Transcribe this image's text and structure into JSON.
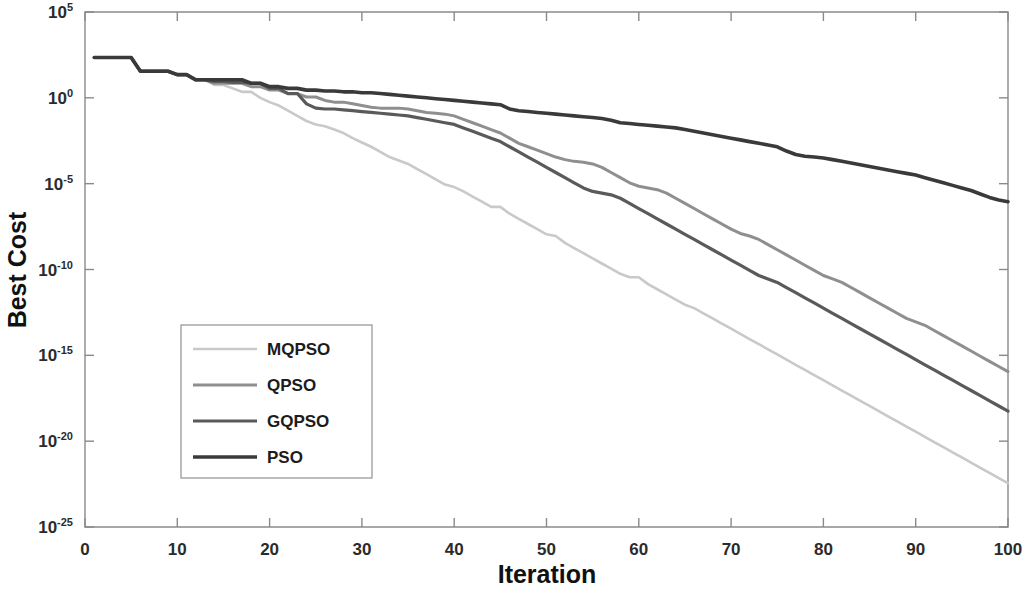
{
  "chart_data": {
    "type": "line",
    "title": "",
    "xlabel": "Iteration",
    "ylabel": "Best Cost",
    "xlim": [
      0,
      100
    ],
    "ylim_log10": [
      -25,
      5
    ],
    "yscale": "log",
    "grid": false,
    "legend_position": "center-left",
    "x_ticks": [
      0,
      10,
      20,
      30,
      40,
      50,
      60,
      70,
      80,
      90,
      100
    ],
    "x_tick_labels": [
      "0",
      "10",
      "20",
      "30",
      "40",
      "50",
      "60",
      "70",
      "80",
      "90",
      "100"
    ],
    "y_ticks_log10": [
      5,
      0,
      -5,
      -10,
      -15,
      -20,
      -25
    ],
    "y_tick_labels": [
      "10^5",
      "10^0",
      "10^-5",
      "10^-10",
      "10^-15",
      "10^-20",
      "10^-25"
    ],
    "y_tick_mantissa": [
      "10",
      "10",
      "10",
      "10",
      "10",
      "10",
      "10"
    ],
    "y_tick_exponents": [
      "5",
      "0",
      "-5",
      "-10",
      "-15",
      "-20",
      "-25"
    ],
    "x": [
      1,
      2,
      3,
      4,
      5,
      6,
      7,
      8,
      9,
      10,
      11,
      12,
      13,
      14,
      15,
      16,
      17,
      18,
      19,
      20,
      21,
      22,
      23,
      24,
      25,
      26,
      27,
      28,
      29,
      30,
      31,
      32,
      33,
      34,
      35,
      36,
      37,
      38,
      39,
      40,
      41,
      42,
      43,
      44,
      45,
      46,
      47,
      48,
      49,
      50,
      51,
      52,
      53,
      54,
      55,
      56,
      57,
      58,
      59,
      60,
      61,
      62,
      63,
      64,
      65,
      66,
      67,
      68,
      69,
      70,
      71,
      72,
      73,
      74,
      75,
      76,
      77,
      78,
      79,
      80,
      81,
      82,
      83,
      84,
      85,
      86,
      87,
      88,
      89,
      90,
      91,
      92,
      93,
      94,
      95,
      96,
      97,
      98,
      99,
      100
    ],
    "series": [
      {
        "name": "MQPSO",
        "color": "#c9c9c9",
        "width": 2.6,
        "values_log10": [
          2.35,
          2.35,
          2.35,
          2.35,
          2.35,
          1.55,
          1.55,
          1.55,
          1.55,
          1.35,
          1.35,
          1.05,
          1.05,
          0.75,
          0.75,
          0.55,
          0.35,
          0.35,
          0.0,
          -0.25,
          -0.45,
          -0.75,
          -1.05,
          -1.35,
          -1.55,
          -1.65,
          -1.85,
          -2.05,
          -2.35,
          -2.6,
          -2.85,
          -3.15,
          -3.45,
          -3.65,
          -3.85,
          -4.15,
          -4.45,
          -4.75,
          -5.05,
          -5.2,
          -5.45,
          -5.75,
          -6.05,
          -6.35,
          -6.35,
          -6.75,
          -7.05,
          -7.35,
          -7.65,
          -7.95,
          -8.05,
          -8.45,
          -8.75,
          -9.05,
          -9.35,
          -9.65,
          -9.95,
          -10.25,
          -10.45,
          -10.45,
          -10.85,
          -11.15,
          -11.45,
          -11.75,
          -12.05,
          -12.25,
          -12.55,
          -12.85,
          -13.15,
          -13.45,
          -13.75,
          -14.05,
          -14.35,
          -14.65,
          -14.95,
          -15.25,
          -15.55,
          -15.85,
          -16.15,
          -16.45,
          -16.75,
          -17.05,
          -17.35,
          -17.65,
          -17.95,
          -18.25,
          -18.55,
          -18.85,
          -19.15,
          -19.45,
          -19.75,
          -20.05,
          -20.35,
          -20.65,
          -20.95,
          -21.25,
          -21.55,
          -21.85,
          -22.15,
          -22.45,
          -22.75
        ]
      },
      {
        "name": "QPSO",
        "color": "#8f8f8f",
        "width": 3.0,
        "values_log10": [
          2.35,
          2.35,
          2.35,
          2.35,
          2.35,
          1.55,
          1.55,
          1.55,
          1.55,
          1.35,
          1.35,
          1.05,
          1.05,
          0.85,
          0.85,
          0.85,
          0.85,
          0.65,
          0.65,
          0.45,
          0.45,
          0.25,
          0.25,
          0.05,
          0.05,
          -0.15,
          -0.25,
          -0.25,
          -0.35,
          -0.45,
          -0.55,
          -0.6,
          -0.6,
          -0.6,
          -0.65,
          -0.75,
          -0.85,
          -0.9,
          -0.95,
          -1.05,
          -1.25,
          -1.45,
          -1.65,
          -1.85,
          -2.05,
          -2.35,
          -2.65,
          -2.85,
          -3.05,
          -3.25,
          -3.45,
          -3.6,
          -3.7,
          -3.75,
          -3.85,
          -4.05,
          -4.35,
          -4.65,
          -4.95,
          -5.15,
          -5.25,
          -5.35,
          -5.55,
          -5.85,
          -6.15,
          -6.45,
          -6.75,
          -7.05,
          -7.35,
          -7.65,
          -7.9,
          -8.05,
          -8.25,
          -8.55,
          -8.85,
          -9.15,
          -9.45,
          -9.75,
          -10.05,
          -10.35,
          -10.55,
          -10.75,
          -11.05,
          -11.35,
          -11.65,
          -11.95,
          -12.25,
          -12.55,
          -12.85,
          -13.05,
          -13.25,
          -13.55,
          -13.85,
          -14.15,
          -14.45,
          -14.75,
          -15.05,
          -15.35,
          -15.65,
          -15.95,
          -16.15
        ]
      },
      {
        "name": "GQPSO",
        "color": "#5a5a5a",
        "width": 3.2,
        "values_log10": [
          2.35,
          2.35,
          2.35,
          2.35,
          2.35,
          1.55,
          1.55,
          1.55,
          1.55,
          1.35,
          1.35,
          1.05,
          1.05,
          0.95,
          0.95,
          0.9,
          0.9,
          0.85,
          0.85,
          0.55,
          0.55,
          0.25,
          0.25,
          -0.35,
          -0.6,
          -0.65,
          -0.65,
          -0.7,
          -0.75,
          -0.8,
          -0.85,
          -0.9,
          -0.95,
          -1.0,
          -1.05,
          -1.15,
          -1.25,
          -1.35,
          -1.45,
          -1.55,
          -1.75,
          -1.95,
          -2.15,
          -2.35,
          -2.55,
          -2.85,
          -3.15,
          -3.45,
          -3.75,
          -4.05,
          -4.35,
          -4.65,
          -4.95,
          -5.25,
          -5.45,
          -5.55,
          -5.65,
          -5.85,
          -6.15,
          -6.45,
          -6.75,
          -7.05,
          -7.35,
          -7.65,
          -7.95,
          -8.25,
          -8.55,
          -8.85,
          -9.15,
          -9.45,
          -9.75,
          -10.05,
          -10.35,
          -10.55,
          -10.75,
          -11.05,
          -11.35,
          -11.65,
          -11.95,
          -12.25,
          -12.55,
          -12.85,
          -13.15,
          -13.45,
          -13.75,
          -14.05,
          -14.35,
          -14.65,
          -14.95,
          -15.25,
          -15.55,
          -15.85,
          -16.15,
          -16.45,
          -16.75,
          -17.05,
          -17.35,
          -17.65,
          -17.95,
          -18.25,
          -18.55
        ]
      },
      {
        "name": "PSO",
        "color": "#3a3a3a",
        "width": 3.6,
        "values_log10": [
          2.35,
          2.35,
          2.35,
          2.35,
          2.35,
          1.55,
          1.55,
          1.55,
          1.55,
          1.35,
          1.35,
          1.05,
          1.05,
          1.05,
          1.05,
          1.05,
          1.05,
          0.85,
          0.85,
          0.65,
          0.65,
          0.55,
          0.55,
          0.45,
          0.45,
          0.4,
          0.4,
          0.35,
          0.35,
          0.3,
          0.3,
          0.25,
          0.2,
          0.15,
          0.1,
          0.05,
          0.0,
          -0.05,
          -0.1,
          -0.15,
          -0.2,
          -0.25,
          -0.3,
          -0.35,
          -0.4,
          -0.65,
          -0.75,
          -0.8,
          -0.85,
          -0.9,
          -0.95,
          -1.0,
          -1.05,
          -1.1,
          -1.15,
          -1.2,
          -1.3,
          -1.45,
          -1.5,
          -1.55,
          -1.6,
          -1.65,
          -1.7,
          -1.75,
          -1.85,
          -1.95,
          -2.05,
          -2.15,
          -2.25,
          -2.35,
          -2.45,
          -2.55,
          -2.65,
          -2.75,
          -2.85,
          -3.1,
          -3.3,
          -3.4,
          -3.45,
          -3.5,
          -3.6,
          -3.7,
          -3.8,
          -3.9,
          -4.0,
          -4.1,
          -4.2,
          -4.3,
          -4.4,
          -4.5,
          -4.65,
          -4.8,
          -4.95,
          -5.1,
          -5.25,
          -5.4,
          -5.6,
          -5.8,
          -5.95,
          -6.05
        ]
      }
    ],
    "legend_entries": [
      {
        "label": "MQPSO",
        "color": "#c9c9c9"
      },
      {
        "label": "QPSO",
        "color": "#8f8f8f"
      },
      {
        "label": "GQPSO",
        "color": "#5a5a5a"
      },
      {
        "label": "PSO",
        "color": "#3a3a3a"
      }
    ]
  },
  "axes": {
    "x_title": "Iteration",
    "y_title": "Best Cost"
  },
  "colors": {
    "background": "#ffffff",
    "axis": "#8a8a8a",
    "text": "#1c1c1c"
  }
}
